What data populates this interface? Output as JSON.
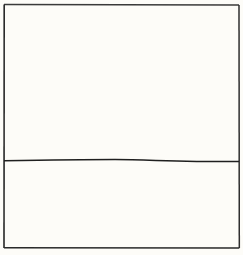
{
  "diagram": {
    "type": "divided-box",
    "colors": {
      "background": "#fdfcf8",
      "stroke": "#2a2a2a"
    },
    "outer_box": {
      "x": 4,
      "y": 4,
      "width": 235,
      "height": 244
    },
    "divider": {
      "orientation": "horizontal",
      "y_left": 160.5,
      "y_right": 161.5
    },
    "sections": [
      {
        "name": "top",
        "label": ""
      },
      {
        "name": "bottom",
        "label": ""
      }
    ]
  }
}
